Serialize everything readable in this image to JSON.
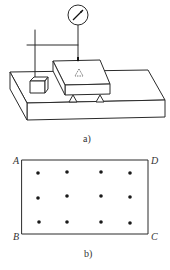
{
  "figure": {
    "panel_a": {
      "caption": "a)",
      "elements": [
        "dial-gauge",
        "gauge-stand",
        "surface-plate",
        "gauge-block",
        "measured-plate",
        "support-feet"
      ],
      "center_mark": "△"
    },
    "panel_b": {
      "caption": "b)",
      "corners": {
        "top_left": "A",
        "top_right": "D",
        "bottom_right": "C",
        "bottom_left": "B"
      },
      "grid": {
        "rows": 3,
        "cols": 4,
        "points": [
          [
            38,
            173
          ],
          [
            67,
            172
          ],
          [
            101,
            172
          ],
          [
            130,
            173
          ],
          [
            38,
            198
          ],
          [
            67,
            196
          ],
          [
            101,
            196
          ],
          [
            130,
            197
          ],
          [
            39,
            222
          ],
          [
            67,
            222
          ],
          [
            101,
            222
          ],
          [
            130,
            223
          ]
        ]
      }
    },
    "colors": {
      "line": "#2a2a2a",
      "dot": "#1a1a1a",
      "background": "#ffffff"
    }
  }
}
